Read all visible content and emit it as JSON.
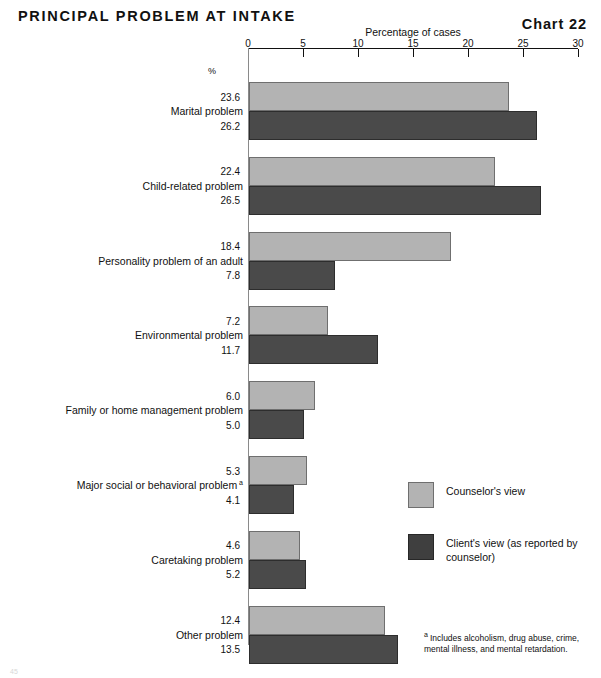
{
  "header": {
    "title": "PRINCIPAL PROBLEM AT INTAKE",
    "chart_number": "Chart 22"
  },
  "axis": {
    "title": "Percentage of cases",
    "tick_labels": [
      "0",
      "5",
      "10",
      "15",
      "20",
      "25",
      "30"
    ],
    "percent_marker": "%"
  },
  "legend": {
    "items": [
      {
        "label": "Counselor's view",
        "color": "#b3b3b3"
      },
      {
        "label": "Client's view (as reported by counselor)",
        "color": "#3f3f3f"
      }
    ]
  },
  "footnote": {
    "marker": "a",
    "text": "Includes alcoholism, drug abuse, crime, mental illness, and mental retardation."
  },
  "page_mark": "45",
  "chart_data": {
    "type": "bar",
    "orientation": "horizontal",
    "title": "PRINCIPAL PROBLEM AT INTAKE",
    "xlabel": "Percentage of cases",
    "ylabel": "",
    "xlim": [
      0,
      30
    ],
    "xticks": [
      0,
      5,
      10,
      15,
      20,
      25,
      30
    ],
    "grid": false,
    "legend_position": "lower-right",
    "categories": [
      "Marital problem",
      "Child-related problem",
      "Personality problem of an adult",
      "Environmental problem",
      "Family or home management problem",
      "Major social or behavioral problem",
      "Caretaking problem",
      "Other problem"
    ],
    "category_footnote_markers": [
      "",
      "",
      "",
      "",
      "",
      "a",
      "",
      ""
    ],
    "series": [
      {
        "name": "Counselor's view",
        "color": "#b3b3b3",
        "values": [
          23.6,
          22.4,
          18.4,
          7.2,
          6.0,
          5.3,
          4.6,
          12.4
        ]
      },
      {
        "name": "Client's view (as reported by counselor)",
        "color": "#4a4a4a",
        "values": [
          26.2,
          26.5,
          7.8,
          11.7,
          5.0,
          4.1,
          5.2,
          13.5
        ]
      }
    ]
  }
}
